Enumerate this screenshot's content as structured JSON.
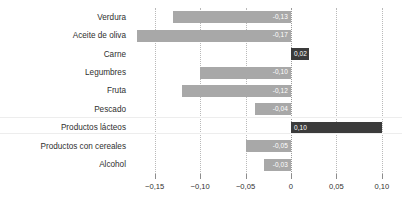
{
  "chart_data": {
    "type": "bar",
    "orientation": "horizontal",
    "title": "",
    "xlabel": "",
    "ylabel": "",
    "categories": [
      "Verdura",
      "Aceite de oliva",
      "Carne",
      "Legumbres",
      "Fruta",
      "Pescado",
      "Productos lácteos",
      "Productos con cereales",
      "Alcohol"
    ],
    "values": [
      -0.13,
      -0.17,
      0.02,
      -0.1,
      -0.12,
      -0.04,
      0.1,
      -0.05,
      -0.03
    ],
    "value_labels": [
      "-0,13",
      "-0,17",
      "0,02",
      "-0,10",
      "-0,12",
      "-0,04",
      "0,10",
      "-0,05",
      "-0,03"
    ],
    "xlim": [
      -0.175,
      0.12
    ],
    "xticks": [
      -0.15,
      -0.1,
      -0.05,
      0,
      0.05,
      0.1
    ],
    "xtick_labels": [
      "−0,15",
      "−0,10",
      "−0,05",
      "0",
      "0,05",
      "0,10"
    ],
    "grid": true,
    "legend": null,
    "colors": {
      "negative_bar": "#a8a8a8",
      "positive_bar": "#3b3b3b",
      "value_label": "#ffffff",
      "gridline": "#b9b9b9",
      "axis_text": "#2f2f2f",
      "background": "#ffffff"
    }
  }
}
